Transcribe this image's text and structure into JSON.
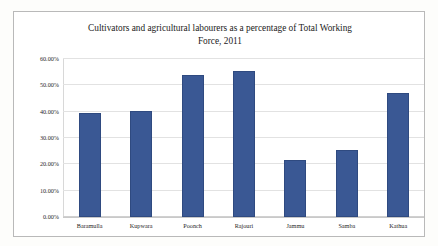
{
  "chart_data": {
    "type": "bar",
    "title": "Cultivators and agricultural labourers as a percentage of Total Working Force, 2011",
    "title_line1": "Cultivators and agricultural labourers as a percentage of Total Working",
    "title_line2": "Force, 2011",
    "xlabel": "",
    "ylabel": "",
    "categories": [
      "Baramulla",
      "Kupwara",
      "Poonch",
      "Rajouri",
      "Jammu",
      "Samba",
      "Kathua"
    ],
    "values": [
      39.5,
      40.3,
      53.8,
      55.3,
      21.5,
      25.5,
      47.0
    ],
    "ylim": [
      0,
      60
    ],
    "ytick_values": [
      0,
      10,
      20,
      30,
      40,
      50,
      60
    ],
    "ytick_labels": [
      "0.00%",
      "10.00%",
      "20.00%",
      "30.00%",
      "40.00%",
      "50.00%",
      "60.00%"
    ],
    "grid": true,
    "legend": false,
    "series_color": "#3a5894",
    "gridline_color": "#e2e2e2",
    "border_color": "#b9b9b9"
  }
}
